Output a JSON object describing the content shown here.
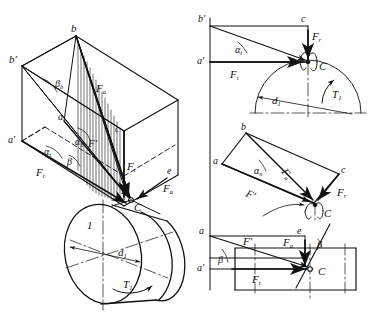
{
  "figure": {
    "type": "engineering-diagram",
    "views": [
      "isometric-pictorial",
      "front-view",
      "side-view",
      "top-view"
    ],
    "stroke_color": "#111111",
    "background": "#ffffff"
  },
  "iso": {
    "vertex_b": "b",
    "vertex_b_prime": "b′",
    "vertex_a": "a",
    "vertex_a_prime": "a′",
    "vertex_c": "c",
    "vertex_e": "e",
    "point_C": "C",
    "angle_beta_b": "β",
    "angle_beta_b_sub": "b",
    "angle_alpha_b": "α",
    "angle_alpha_b_sub": "b",
    "angle_alpha_t": "α",
    "angle_alpha_t_sub": "t",
    "angle_beta": "β",
    "force_Fa": "F",
    "force_Fa_sub": "a",
    "force_Ft": "F",
    "force_Ft_sub": "t",
    "force_Fr": "F",
    "force_Fr_sub": "r",
    "force_Fprime": "F′",
    "force_Fa2": "F",
    "force_Fa2_sub": "a"
  },
  "cylinder": {
    "label_1": "1",
    "diameter": "d",
    "diameter_sub": "1",
    "torque": "T",
    "torque_sub": "1"
  },
  "view_front": {
    "vertex_b_prime": "b′",
    "vertex_c": "c",
    "vertex_a_prime": "a′",
    "point_C": "C",
    "angle_alpha_t": "α",
    "angle_alpha_t_sub": "t",
    "force_Ft_vert": "F",
    "force_Ft_vert_sub": "r",
    "force_Ft_horiz": "F",
    "force_Ft_horiz_sub": "t",
    "diameter": "d",
    "diameter_sub": "1",
    "torque": "T",
    "torque_sub": "1"
  },
  "view_side": {
    "vertex_b": "b",
    "vertex_a": "a",
    "vertex_c": "c",
    "point_C": "C",
    "angle_alpha_n": "α",
    "angle_alpha_n_sub": "n",
    "force_Fn": "F",
    "force_Fn_sub": "n",
    "force_Fprime": "F′",
    "force_Fr": "F",
    "force_Fr_sub": "r"
  },
  "view_top": {
    "vertex_a": "a",
    "vertex_a_prime": "a′",
    "vertex_e": "e",
    "point_C": "C",
    "point_C2": "C",
    "angle_beta": "β",
    "angle_beta2": "β",
    "force_Fprime": "F′",
    "force_Fa": "F",
    "force_Fa_sub": "a",
    "force_Ft": "F",
    "force_Ft_sub": "t"
  }
}
